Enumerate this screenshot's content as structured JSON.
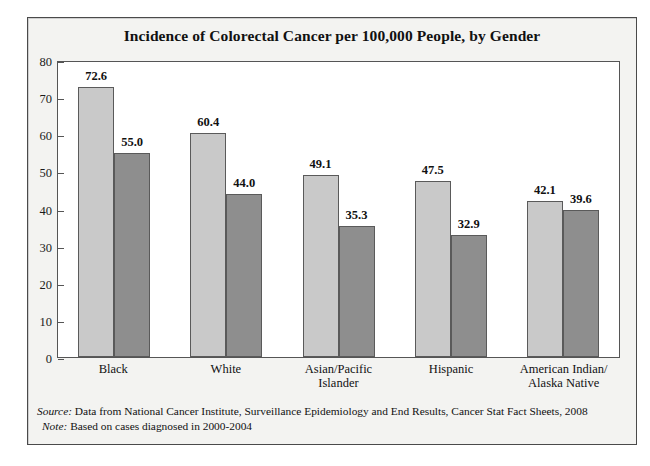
{
  "chart_data": {
    "type": "bar",
    "title": "Incidence of Colorectal Cancer per 100,000 People, by Gender",
    "xlabel": "",
    "ylabel": "",
    "ylim": [
      0,
      80
    ],
    "yticks": [
      0,
      10,
      20,
      30,
      40,
      50,
      60,
      70,
      80
    ],
    "grid": false,
    "legend_position": "top-right",
    "categories": [
      "Black",
      "White",
      "Asian/Pacific Islander",
      "Hispanic",
      "American Indian/ Alaska Native"
    ],
    "category_lines": [
      [
        "Black"
      ],
      [
        "White"
      ],
      [
        "Asian/Pacific",
        "Islander"
      ],
      [
        "Hispanic"
      ],
      [
        "American Indian/",
        "Alaska Native"
      ]
    ],
    "series": [
      {
        "name": "Men",
        "color": "#c9c9c9",
        "values": [
          72.6,
          60.4,
          49.1,
          47.5,
          42.1
        ],
        "labels": [
          "72.6",
          "60.4",
          "49.1",
          "47.5",
          "42.1"
        ]
      },
      {
        "name": "Women",
        "color": "#8e8e8e",
        "values": [
          55.0,
          44.0,
          35.3,
          32.9,
          39.6
        ],
        "labels": [
          "55.0",
          "44.0",
          "35.3",
          "32.9",
          "39.6"
        ]
      }
    ]
  },
  "legend": {
    "items": [
      {
        "label": "Men",
        "color": "#c9c9c9"
      },
      {
        "label": "Women",
        "color": "#8e8e8e"
      }
    ]
  },
  "footnotes": {
    "source_key": "Source:",
    "source_text": " Data from National Cancer Institute, Surveillance Epidemiology and End Results, Cancer Stat Fact Sheets, 2008",
    "note_key": "Note:",
    "note_text": " Based on cases diagnosed in 2000-2004"
  },
  "colors": {
    "men_bar": "#c9c9c9",
    "women_bar": "#8e8e8e",
    "frame": "#4a4a4a",
    "panel_background": "#f3f3f1",
    "plot_background": "#ffffff",
    "text": "#111111"
  }
}
